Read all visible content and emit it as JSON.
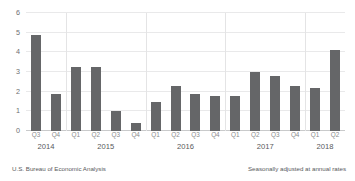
{
  "chart_data": {
    "type": "bar",
    "title": "",
    "subtitle": "",
    "xlabel": "",
    "ylabel": "",
    "ylim": [
      0,
      6
    ],
    "yticks": [
      0,
      1,
      2,
      3,
      4,
      5,
      6
    ],
    "grid": true,
    "legend": null,
    "bar_color": "#656668",
    "gridline_color": "#e9e9ea",
    "categories": [
      "Q3",
      "Q4",
      "Q1",
      "Q2",
      "Q3",
      "Q4",
      "Q1",
      "Q2",
      "Q3",
      "Q4",
      "Q1",
      "Q2",
      "Q3",
      "Q4",
      "Q1",
      "Q2"
    ],
    "values": [
      4.9,
      1.9,
      3.25,
      3.25,
      1.0,
      0.4,
      1.5,
      2.3,
      1.9,
      1.8,
      1.8,
      3.0,
      2.8,
      2.3,
      2.2,
      4.1
    ],
    "year_groups": [
      {
        "label": "2014",
        "count": 2
      },
      {
        "label": "2015",
        "count": 4
      },
      {
        "label": "2016",
        "count": 4
      },
      {
        "label": "2017",
        "count": 4
      },
      {
        "label": "2018",
        "count": 2
      }
    ],
    "annotations": {
      "source": "U.S. Bureau of Economic Analysis",
      "adjustment": "Seasonally adjusted at annual rates"
    }
  },
  "footer": {
    "source": "U.S. Bureau of Economic Analysis",
    "adjustment": "Seasonally adjusted at annual rates"
  }
}
